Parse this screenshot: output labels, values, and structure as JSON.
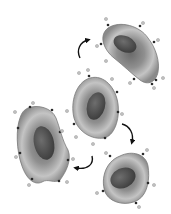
{
  "diagram": {
    "colors": {
      "background": "#ffffff",
      "cell_edge": "#6e6e6e",
      "cell_mid": "#9a9a9a",
      "cell_light": "#c8c8c8",
      "nucleus": "#4a4a4a",
      "nucleus_light": "#7a7a7a",
      "receptor": "#333333",
      "ligand": "#b5b5b5",
      "arrow": "#111111"
    },
    "cells": [
      {
        "id": "cell-top-right",
        "label": ""
      },
      {
        "id": "cell-center",
        "label": ""
      },
      {
        "id": "cell-left",
        "label": ""
      },
      {
        "id": "cell-bottom-right",
        "label": ""
      }
    ],
    "arrows": [
      {
        "id": "arrow-center-to-top-right"
      },
      {
        "id": "arrow-center-to-bottom-right"
      },
      {
        "id": "arrow-to-left"
      }
    ]
  }
}
